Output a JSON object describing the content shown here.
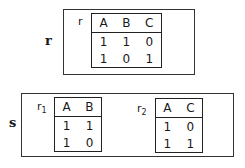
{
  "relation_r": {
    "outer_label": "r",
    "inner_label": "r",
    "columns": [
      "A",
      "B",
      "C"
    ],
    "rows": [
      [
        "1",
        "1",
        "0"
      ],
      [
        "1",
        "0",
        "1"
      ]
    ]
  },
  "relation_s": {
    "outer_label": "s",
    "tables": [
      {
        "label": "r",
        "subscript": "1",
        "columns": [
          "A",
          "B"
        ],
        "rows": [
          [
            "1",
            "1"
          ],
          [
            "1",
            "0"
          ]
        ]
      },
      {
        "label": "r",
        "subscript": "2",
        "columns": [
          "A",
          "C"
        ],
        "rows": [
          [
            "1",
            "0"
          ],
          [
            "1",
            "1"
          ]
        ]
      }
    ]
  }
}
